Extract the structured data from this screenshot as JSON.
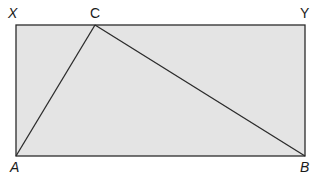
{
  "diagram": {
    "type": "geometry-figure",
    "colors": {
      "fill": "#e4e4e4",
      "stroke": "#2b2b2b",
      "label": "#1a1a1a"
    },
    "points": {
      "X": {
        "label": "X",
        "x": 16,
        "y": 25
      },
      "Y": {
        "label": "Y",
        "x": 305,
        "y": 25
      },
      "A": {
        "label": "A",
        "x": 16,
        "y": 156
      },
      "B": {
        "label": "B",
        "x": 305,
        "y": 156
      },
      "C": {
        "label": "C",
        "x": 95,
        "y": 25
      }
    },
    "labels": {
      "X": "X",
      "C": "C",
      "Y": "Y",
      "A": "A",
      "B": "B"
    },
    "segments": [
      [
        "X",
        "Y"
      ],
      [
        "Y",
        "B"
      ],
      [
        "B",
        "A"
      ],
      [
        "A",
        "X"
      ],
      [
        "A",
        "C"
      ],
      [
        "C",
        "B"
      ]
    ]
  }
}
